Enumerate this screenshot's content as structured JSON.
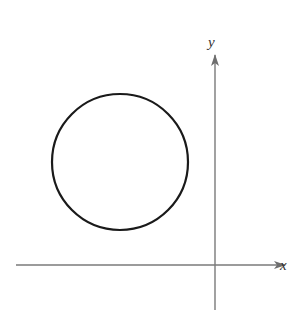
{
  "diagram": {
    "type": "coordinate-plane",
    "axes": {
      "x_label": "x",
      "y_label": "y",
      "color": "#7a7a7a",
      "origin": {
        "x": 215,
        "y": 265
      },
      "x_axis": {
        "x1": 16,
        "x2": 285,
        "y": 265
      },
      "y_axis": {
        "x": 215,
        "y1": 55,
        "y2": 310
      }
    },
    "shapes": [
      {
        "kind": "circle",
        "cx": 120,
        "cy": 162,
        "r": 68,
        "stroke": "#1a1a1a",
        "quadrant": "II"
      }
    ]
  }
}
